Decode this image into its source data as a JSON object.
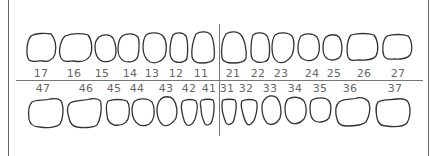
{
  "chart": {
    "title": "",
    "colors": {
      "outline": "#333333",
      "lines": "#777777",
      "labels": "#666666",
      "background": "#ffffff"
    }
  },
  "upper": {
    "teeth": [
      {
        "number": "17",
        "cx": 41,
        "label_x": 41
      },
      {
        "number": "16",
        "cx": 75,
        "label_x": 74
      },
      {
        "number": "15",
        "cx": 106,
        "label_x": 102
      },
      {
        "number": "14",
        "cx": 129,
        "label_x": 130
      },
      {
        "number": "13",
        "cx": 154,
        "label_x": 152
      },
      {
        "number": "12",
        "cx": 178,
        "label_x": 176
      },
      {
        "number": "11",
        "cx": 203,
        "label_x": 201
      },
      {
        "number": "21",
        "cx": 234,
        "label_x": 233
      },
      {
        "number": "22",
        "cx": 260,
        "label_x": 258
      },
      {
        "number": "23",
        "cx": 283,
        "label_x": 281
      },
      {
        "number": "24",
        "cx": 309,
        "label_x": 312
      },
      {
        "number": "25",
        "cx": 333,
        "label_x": 334
      },
      {
        "number": "26",
        "cx": 363,
        "label_x": 364
      },
      {
        "number": "27",
        "cx": 397,
        "label_x": 398
      }
    ]
  },
  "lower": {
    "teeth": [
      {
        "number": "47",
        "cx": 46,
        "label_x": 43
      },
      {
        "number": "46",
        "cx": 85,
        "label_x": 86
      },
      {
        "number": "45",
        "cx": 118,
        "label_x": 114
      },
      {
        "number": "44",
        "cx": 143,
        "label_x": 137
      },
      {
        "number": "43",
        "cx": 167,
        "label_x": 166
      },
      {
        "number": "42",
        "cx": 189,
        "label_x": 189
      },
      {
        "number": "41",
        "cx": 207,
        "label_x": 209
      },
      {
        "number": "31",
        "cx": 230,
        "label_x": 227
      },
      {
        "number": "32",
        "cx": 248,
        "label_x": 246
      },
      {
        "number": "33",
        "cx": 271,
        "label_x": 270
      },
      {
        "number": "34",
        "cx": 295,
        "label_x": 295
      },
      {
        "number": "35",
        "cx": 320,
        "label_x": 320
      },
      {
        "number": "36",
        "cx": 353,
        "label_x": 350
      },
      {
        "number": "37",
        "cx": 392,
        "label_x": 395
      }
    ]
  }
}
